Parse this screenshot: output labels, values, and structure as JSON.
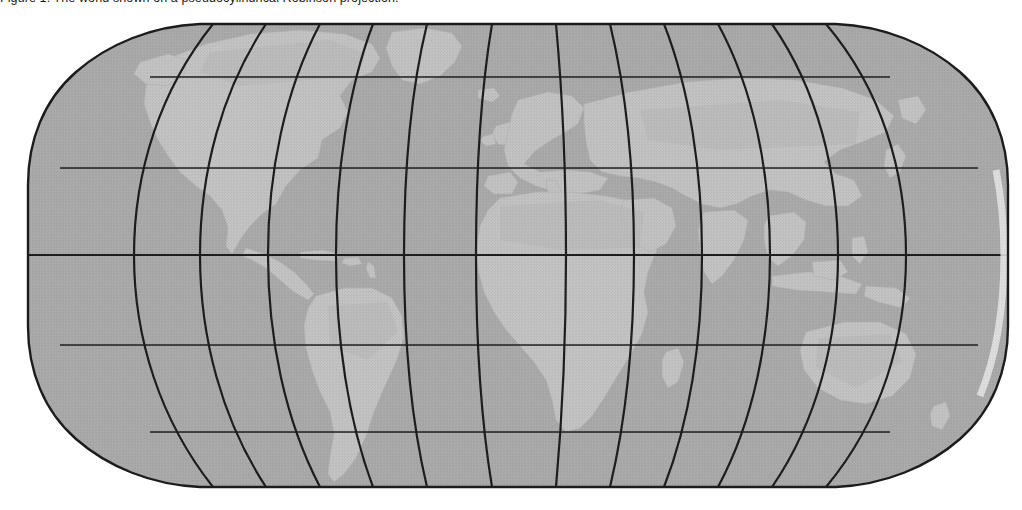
{
  "figure": {
    "caption_prefix": "Figure",
    "caption_text": "Figure 1.  The world shown on a pseudocylindrical Robinson projection.",
    "projection_name": "Robinson projection"
  },
  "map": {
    "name": "world-map",
    "projection": "robinson",
    "central_meridian_deg": 0,
    "bounds_px": {
      "left": 28,
      "right": 1008,
      "top": 24,
      "bottom": 487
    },
    "flat_edge_px": {
      "top_left_x": 200,
      "top_right_x": 836,
      "bottom_left_x": 200,
      "bottom_right_x": 836
    },
    "colors": {
      "ocean": "#a9a9a9",
      "land": "#c2c2c2",
      "land_shade": "#b4b4b4",
      "outline": "#1c1c1c",
      "graticule": "#1c1c1c",
      "highlight_rim": "#e8e8e8",
      "background": "#ffffff"
    },
    "graticule": {
      "visible": true,
      "meridian_interval_deg": 30,
      "parallel_interval_deg": 30,
      "meridian_count": 11,
      "parallel_count": 5,
      "equator_emphasized": true,
      "meridian_longitudes_deg": [
        -150,
        -120,
        -90,
        -60,
        -30,
        0,
        30,
        60,
        90,
        120,
        150
      ],
      "parallel_latitudes_deg": [
        60,
        30,
        0,
        -30,
        -60
      ],
      "parallel_y_px": [
        77,
        168,
        255,
        345,
        432
      ],
      "equator_y_px": 255,
      "meridian_equator_x_px": [
        103,
        186,
        269,
        352,
        435,
        518,
        601,
        684,
        767,
        850,
        933
      ]
    },
    "landmasses": [
      "North America",
      "Greenland",
      "Central America",
      "South America",
      "Europe",
      "Africa",
      "Asia",
      "Arabia",
      "India",
      "Southeast Asia",
      "Australia",
      "Japan",
      "Madagascar",
      "British Isles",
      "Caribbean islands",
      "New Zealand"
    ]
  }
}
